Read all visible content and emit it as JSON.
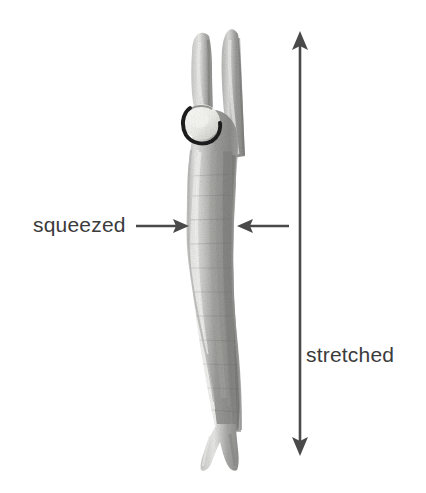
{
  "figure": {
    "background_color": "#ffffff",
    "width": 426,
    "height": 493
  },
  "annotations": {
    "squeezed": {
      "label": "squeezed",
      "text_color": "#3b3b3b",
      "arrows": [
        {
          "name": "squeezed-arrow-left",
          "direction": "right",
          "from_x": 136,
          "to_x": 189,
          "y": 226
        },
        {
          "name": "squeezed-arrow-right",
          "direction": "left",
          "from_x": 289,
          "to_x": 237,
          "y": 226
        }
      ]
    },
    "stretched": {
      "label": "stretched",
      "text_color": "#3b3b3b",
      "arrow": {
        "name": "stretched-arrow-vertical",
        "direction": "double-headed-vertical",
        "x": 300,
        "from_y": 31,
        "to_y": 456
      }
    }
  },
  "colors": {
    "arrow": "#4a4a4a",
    "text": "#3b3b3b",
    "specimen_dark": "#8e8e8e",
    "specimen_mid": "#a8a8a8",
    "specimen_light": "#cfcfcf",
    "specimen_highlight": "#ececec",
    "ring_outline": "#1c1c1c",
    "ring_fill": "#f2f2ef"
  }
}
